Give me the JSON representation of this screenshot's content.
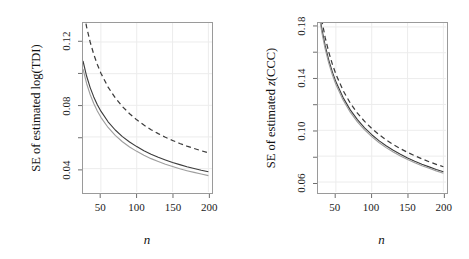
{
  "figure": {
    "background": "#ffffff",
    "frame_color": "#9a9a9a",
    "grid_color": "#ececec"
  },
  "chart_data": [
    {
      "type": "line",
      "panel": "left",
      "title": "",
      "xlabel": "n",
      "ylabel": "SE of estimated log(TDI)",
      "xlim": [
        25,
        205
      ],
      "ylim": [
        0.025,
        0.132
      ],
      "xticks": [
        50,
        100,
        150,
        200
      ],
      "xtick_labels": [
        "50",
        "100",
        "150",
        "200"
      ],
      "yticks": [
        0.04,
        0.08,
        0.12
      ],
      "ytick_labels": [
        "0.04",
        "0.08",
        "0.12"
      ],
      "yminor_ticks": [
        0.06,
        0.1
      ],
      "grid": true,
      "legend": "none",
      "x": [
        25,
        30,
        35,
        40,
        45,
        50,
        60,
        70,
        80,
        90,
        100,
        110,
        120,
        130,
        140,
        150,
        160,
        170,
        180,
        190,
        200
      ],
      "series": [
        {
          "name": "upper-dashed",
          "style": "dashed",
          "color": "#3c3c3c",
          "values": [
            0.142,
            0.1295,
            0.12,
            0.1122,
            0.1058,
            0.1003,
            0.0915,
            0.0847,
            0.0792,
            0.0747,
            0.0708,
            0.0675,
            0.0646,
            0.0621,
            0.0598,
            0.0578,
            0.0559,
            0.0542,
            0.0527,
            0.0513,
            0.05
          ]
        },
        {
          "name": "middle-solid",
          "style": "solid",
          "color": "#3c3c3c",
          "values": [
            0.108,
            0.0985,
            0.0912,
            0.0853,
            0.0804,
            0.0763,
            0.0696,
            0.0644,
            0.0602,
            0.0568,
            0.0539,
            0.0513,
            0.0491,
            0.0472,
            0.0455,
            0.0439,
            0.0425,
            0.0412,
            0.0401,
            0.039,
            0.038
          ]
        },
        {
          "name": "lower-gray",
          "style": "solid",
          "color": "#9e9e9e",
          "values": [
            0.103,
            0.0938,
            0.0868,
            0.0811,
            0.0764,
            0.0724,
            0.066,
            0.061,
            0.057,
            0.0537,
            0.0509,
            0.0485,
            0.0463,
            0.0445,
            0.0428,
            0.0413,
            0.0399,
            0.0387,
            0.0376,
            0.0366,
            0.0356
          ]
        }
      ]
    },
    {
      "type": "line",
      "panel": "right",
      "title": "",
      "xlabel": "n",
      "ylabel": "SE of estimated z(CCC)",
      "xlim": [
        25,
        205
      ],
      "ylim": [
        0.052,
        0.183
      ],
      "xticks": [
        50,
        100,
        150,
        200
      ],
      "xtick_labels": [
        "50",
        "100",
        "150",
        "200"
      ],
      "yticks": [
        0.06,
        0.1,
        0.14,
        0.18
      ],
      "ytick_labels": [
        "0.06",
        "0.10",
        "0.14",
        "0.18"
      ],
      "yminor_ticks": [
        0.08,
        0.12,
        0.16
      ],
      "grid": true,
      "legend": "none",
      "x": [
        25,
        30,
        35,
        40,
        45,
        50,
        60,
        70,
        80,
        90,
        100,
        110,
        120,
        130,
        140,
        150,
        160,
        170,
        180,
        190,
        200
      ],
      "series": [
        {
          "name": "upper-dashed",
          "style": "dashed",
          "color": "#3c3c3c",
          "values": [
            0.205,
            0.186,
            0.1718,
            0.1605,
            0.1512,
            0.1434,
            0.1308,
            0.1211,
            0.1133,
            0.1069,
            0.1014,
            0.0967,
            0.0926,
            0.089,
            0.0858,
            0.0829,
            0.0803,
            0.0779,
            0.0757,
            0.0737,
            0.0718
          ]
        },
        {
          "name": "middle-solid",
          "style": "solid",
          "color": "#3c3c3c",
          "values": [
            0.198,
            0.1795,
            0.1655,
            0.1543,
            0.1452,
            0.1375,
            0.1253,
            0.1158,
            0.1082,
            0.1019,
            0.0966,
            0.092,
            0.088,
            0.0845,
            0.0814,
            0.0786,
            0.0761,
            0.0738,
            0.0717,
            0.0697,
            0.0679
          ]
        },
        {
          "name": "lower-gray",
          "style": "solid",
          "color": "#9e9e9e",
          "values": [
            0.195,
            0.1768,
            0.163,
            0.152,
            0.143,
            0.1354,
            0.1234,
            0.114,
            0.1065,
            0.1003,
            0.0951,
            0.0906,
            0.0866,
            0.0832,
            0.0801,
            0.0774,
            0.0749,
            0.0726,
            0.0706,
            0.0686,
            0.0668
          ]
        }
      ]
    }
  ]
}
